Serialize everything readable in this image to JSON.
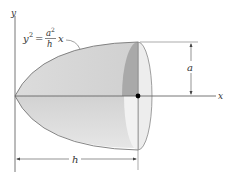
{
  "figure": {
    "equation": {
      "lhs": "y",
      "lhs_exp": "2",
      "equals": "=",
      "num": "a",
      "num_exp": "2",
      "den": "h",
      "rhs": "x"
    },
    "axes": {
      "x_label": "x",
      "y_label": "y"
    },
    "dimensions": {
      "radius_label": "a",
      "length_label": "h"
    },
    "colors": {
      "surface": "#d6d6d6",
      "surface_light": "#e4e4e4",
      "cut_section": "#a9a9a9",
      "end_cap": "#ededed",
      "lines": "#666666",
      "point": "#000000"
    }
  }
}
